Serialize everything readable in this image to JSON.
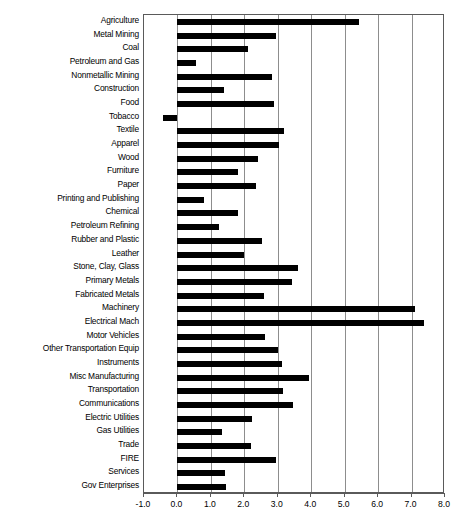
{
  "chart_data": {
    "type": "bar",
    "orientation": "horizontal",
    "title": "",
    "xlabel": "",
    "ylabel": "",
    "xlim": [
      -1.0,
      8.0
    ],
    "grid": true,
    "legend": null,
    "xticks": [
      "-1.0",
      "0.0",
      "1.0",
      "2.0",
      "3.0",
      "4.0",
      "5.0",
      "6.0",
      "7.0",
      "8.0"
    ],
    "xtick_values": [
      -1.0,
      0.0,
      1.0,
      2.0,
      3.0,
      4.0,
      5.0,
      6.0,
      7.0,
      8.0
    ],
    "categories": [
      "Agriculture",
      "Metal Mining",
      "Coal",
      "Petroleum and Gas",
      "Nonmetallic Mining",
      "Construction",
      "Food",
      "Tobacco",
      "Textile",
      "Apparel",
      "Wood",
      "Furniture",
      "Paper",
      "Printing and Publishing",
      "Chemical",
      "Petroleum Refining",
      "Rubber and Plastic",
      "Leather",
      "Stone, Clay, Glass",
      "Primary Metals",
      "Fabricated Metals",
      "Machinery",
      "Electrical Mach",
      "Motor Vehicles",
      "Other Transportation Equip",
      "Instruments",
      "Misc Manufacturing",
      "Transportation",
      "Communications",
      "Electric Utilities",
      "Gas Utilities",
      "Trade",
      "FIRE",
      "Services",
      "Gov Enterprises"
    ],
    "values": [
      5.43,
      2.94,
      2.1,
      0.57,
      2.84,
      1.38,
      2.89,
      -0.42,
      3.2,
      3.04,
      2.42,
      1.8,
      2.35,
      0.8,
      1.8,
      1.24,
      2.54,
      2.0,
      3.6,
      3.44,
      2.6,
      7.1,
      7.37,
      2.62,
      3.0,
      3.12,
      3.92,
      3.15,
      3.45,
      2.22,
      1.32,
      2.2,
      2.94,
      1.42,
      1.44
    ],
    "bar_color": "#000000",
    "grid_color": "#8d8d8d",
    "frame_color": "#5a5a5a",
    "background_color": "#ffffff"
  },
  "caption": ""
}
